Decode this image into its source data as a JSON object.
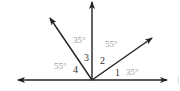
{
  "diagram": {
    "type": "angles-on-a-line",
    "origin": {
      "x": 92,
      "y": 80
    },
    "rays": [
      {
        "name": "left",
        "to": {
          "x": 18,
          "y": 80
        }
      },
      {
        "name": "right",
        "to": {
          "x": 167,
          "y": 80
        }
      },
      {
        "name": "upper-left",
        "to": {
          "x": 50,
          "y": 18
        }
      },
      {
        "name": "vertical",
        "to": {
          "x": 92,
          "y": 2
        }
      },
      {
        "name": "upper-right",
        "to": {
          "x": 152,
          "y": 38
        }
      }
    ],
    "colors": {
      "line": "#222222",
      "angle_number": "#333333",
      "degree_label": "#9a9a9a"
    }
  },
  "labels": {
    "angle_numbers": [
      "1",
      "2",
      "3",
      "4"
    ],
    "degree_values": {
      "angle1": "35°",
      "angle2": "55°",
      "angle3": "35°",
      "angle4": "55°"
    }
  }
}
